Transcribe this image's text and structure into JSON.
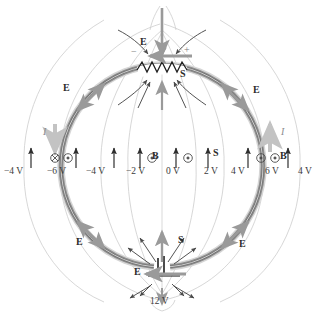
{
  "figure": {
    "type": "physics-circuit-field-diagram",
    "colors": {
      "wire": "#8c8c8c",
      "wire_core": "#6f6f6f",
      "equipotential": "#c9c9c9",
      "field_arrow": "#9a9a9a",
      "dark_arrow": "#4a4a4a",
      "current_arrow": "#bdbdbd",
      "text": "#2b2b2b",
      "volt_text": "#3a3a3a"
    }
  },
  "equipotentials": {
    "left_labels": [
      "−4 V",
      "−6 V",
      "−4 V",
      "−2 V"
    ],
    "center_label": "0 V",
    "right_labels": [
      "2 V",
      "4 V",
      "6 V",
      "4 V"
    ],
    "battery_label": "12 V",
    "all_values": [
      "−4 V",
      "−6 V",
      "−4 V",
      "−2 V",
      "0 V",
      "2 V",
      "4 V",
      "6 V",
      "4 V",
      "12 V"
    ]
  },
  "vectors": {
    "E_top": "E⃗",
    "E_upper_left": "E⃗",
    "E_upper_right": "E⃗",
    "E_lower_left": "E⃗",
    "E_lower_right": "E⃗",
    "E_bottom": "E⃗",
    "S_top": "S⃗",
    "S_bottom": "S⃗",
    "S_middle": "S⃗",
    "B_left": "B⃗",
    "B_right": "B⃗",
    "I_left": "I",
    "I_right": "I"
  },
  "terminals": {
    "resistor_minus": "−",
    "resistor_plus": "+"
  },
  "field_markers": {
    "into_page_symbol": "⊗",
    "out_of_page_symbol": "⊙",
    "left_markers": [
      "⊗",
      "⊙"
    ],
    "center_markers": [
      "⊙",
      "⊙"
    ],
    "right_markers": [
      "⊙",
      "⊙"
    ]
  }
}
